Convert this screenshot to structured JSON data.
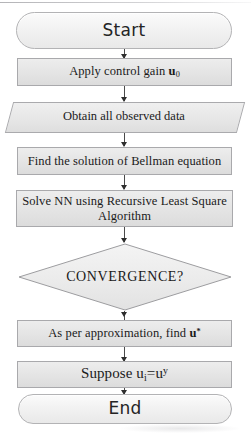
{
  "diagram": {
    "type": "flowchart",
    "orientation": "top-to-bottom",
    "background_color": "#ffffff",
    "shape_fill_color": "#e6e6e6",
    "shape_border_color": "#aaaaad",
    "connector_color": "#4a4a4a",
    "text_color": "#1a1a1a"
  },
  "nodes": [
    {
      "id": "start",
      "shape": "terminator",
      "label": "Start"
    },
    {
      "id": "apply_gain",
      "shape": "process",
      "label_prefix": "Apply control gain ",
      "label_var": "u",
      "label_sub": "0"
    },
    {
      "id": "obtain_data",
      "shape": "parallelogram",
      "label": "Obtain all observed data"
    },
    {
      "id": "bellman",
      "shape": "process",
      "label": "Find the solution of Bellman equation"
    },
    {
      "id": "solve_nn",
      "shape": "process",
      "label_line1": "Solve NN using Recursive Least Square",
      "label_line2": "Algorithm"
    },
    {
      "id": "convergence",
      "shape": "decision",
      "label": "CONVERGENCE?"
    },
    {
      "id": "approximation",
      "shape": "process",
      "label_prefix": "As per approximation, find ",
      "label_var": "u",
      "label_sup": "*"
    },
    {
      "id": "suppose",
      "shape": "process",
      "label_prefix": "Suppose ",
      "label_var1": "u",
      "label_sub1": "i",
      "label_eq": "=",
      "label_var2": "u",
      "label_sup2": "y"
    },
    {
      "id": "end",
      "shape": "terminator",
      "label": "End"
    }
  ],
  "edges": [
    {
      "from": "start",
      "to": "apply_gain",
      "arrow": "down"
    },
    {
      "from": "apply_gain",
      "to": "obtain_data",
      "arrow": "down"
    },
    {
      "from": "obtain_data",
      "to": "bellman",
      "arrow": "down"
    },
    {
      "from": "bellman",
      "to": "solve_nn",
      "arrow": "down"
    },
    {
      "from": "solve_nn",
      "to": "convergence",
      "arrow": "down"
    },
    {
      "from": "convergence",
      "to": "approximation",
      "arrow": "down"
    },
    {
      "from": "approximation",
      "to": "suppose",
      "arrow": "down"
    },
    {
      "from": "suppose",
      "to": "end",
      "arrow": "down"
    }
  ]
}
